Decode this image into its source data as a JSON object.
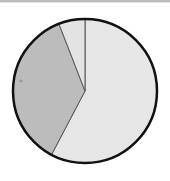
{
  "chart_data": {
    "type": "pie",
    "title": "",
    "labels": [
      "Slice A",
      "Slice B",
      "Slice C"
    ],
    "values": [
      57.7,
      36.4,
      5.9
    ],
    "colors": [
      "#e6e6e6",
      "#bcbcbc",
      "#e3e3e3"
    ],
    "start_angle_deg": 0,
    "direction": "clockwise",
    "legend": "none",
    "border_color": "#111111",
    "edge_color": "#555555",
    "annotations": [
      {
        "type": "marker",
        "x": 21,
        "y": 81,
        "color": "#9a9a9a"
      }
    ]
  },
  "geometry": {
    "cx": 85,
    "cy": 91,
    "r": 72
  }
}
